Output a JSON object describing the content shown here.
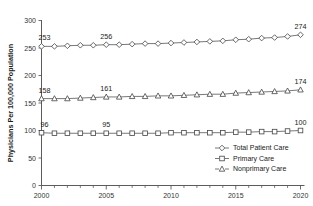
{
  "chart_data": {
    "type": "line",
    "title": "",
    "xlabel": "",
    "ylabel": "Physicians Per 100,000 Population",
    "xlim": [
      2000,
      2020
    ],
    "ylim": [
      0,
      300
    ],
    "grid": false,
    "legend_position": "bottom-right",
    "x": [
      2000,
      2001,
      2002,
      2003,
      2004,
      2005,
      2006,
      2007,
      2008,
      2009,
      2010,
      2011,
      2012,
      2013,
      2014,
      2015,
      2016,
      2017,
      2018,
      2019,
      2020
    ],
    "xtick_labels": [
      "2000",
      "2005",
      "2010",
      "2015",
      "2020"
    ],
    "xticks": [
      2000,
      2005,
      2010,
      2015,
      2020
    ],
    "ytick_labels": [
      "0",
      "50",
      "100",
      "150",
      "200",
      "250",
      "300"
    ],
    "yticks": [
      0,
      50,
      100,
      150,
      200,
      250,
      300
    ],
    "series": [
      {
        "name": "Total Patient Care",
        "marker": "diamond",
        "values": [
          253,
          253,
          254,
          255,
          255,
          256,
          256,
          257,
          258,
          258,
          259,
          260,
          261,
          262,
          263,
          265,
          266,
          268,
          269,
          271,
          274
        ],
        "annotations": [
          {
            "x": 2000,
            "value": 253,
            "text": "253"
          },
          {
            "x": 2005,
            "value": 256,
            "text": "256"
          },
          {
            "x": 2020,
            "value": 274,
            "text": "274"
          }
        ]
      },
      {
        "name": "Primary Care",
        "marker": "square",
        "values": [
          96,
          95,
          95,
          95,
          95,
          95,
          95,
          95,
          95,
          95,
          96,
          96,
          96,
          96,
          96,
          97,
          97,
          98,
          98,
          99,
          100
        ],
        "annotations": [
          {
            "x": 2000,
            "value": 96,
            "text": "96"
          },
          {
            "x": 2005,
            "value": 95,
            "text": "95"
          },
          {
            "x": 2020,
            "value": 100,
            "text": "100"
          }
        ]
      },
      {
        "name": "Nonprimary Care",
        "marker": "triangle",
        "values": [
          158,
          158,
          158,
          159,
          160,
          161,
          161,
          162,
          162,
          163,
          163,
          164,
          165,
          166,
          166,
          168,
          169,
          170,
          171,
          172,
          174
        ],
        "annotations": [
          {
            "x": 2000,
            "value": 158,
            "text": "158"
          },
          {
            "x": 2005,
            "value": 161,
            "text": "161"
          },
          {
            "x": 2020,
            "value": 174,
            "text": "174"
          }
        ]
      }
    ],
    "legend": [
      {
        "label": "Total Patient Care",
        "marker": "diamond"
      },
      {
        "label": "Primary Care",
        "marker": "square"
      },
      {
        "label": "Nonprimary Care",
        "marker": "triangle"
      }
    ],
    "colors": {
      "line": "#555555",
      "marker_fill": "#ffffff",
      "marker_stroke": "#444444",
      "axis": "#4a4a4a",
      "text": "#1a1a1a",
      "background": "#ffffff"
    }
  }
}
